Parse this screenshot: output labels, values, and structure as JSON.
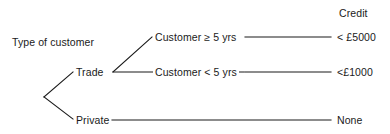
{
  "diagram": {
    "type": "decision-tree",
    "root_label": "Type of customer",
    "outcome_column_header": "Credit",
    "line_color": "#1a1a1a",
    "text_color": "#1a1a1a",
    "background_color": "#ffffff",
    "nodes": {
      "root": "Type of customer",
      "trade": "Trade",
      "private": "Private"
    },
    "branches": [
      {
        "condition": "Customer ≥ 5 yrs",
        "outcome": "< £5000"
      },
      {
        "condition": "Customer < 5 yrs",
        "outcome": "<£1000"
      },
      {
        "condition": "",
        "outcome": "None"
      }
    ]
  }
}
